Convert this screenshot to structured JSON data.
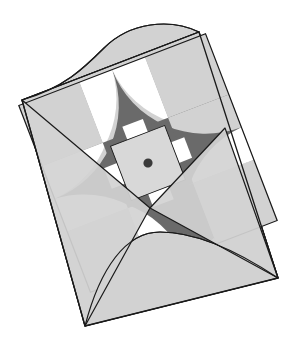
{
  "figure": {
    "type": "geometric-illustration",
    "canvas": {
      "width": 302,
      "height": 360,
      "background": "#ffffff"
    },
    "palette": {
      "white": "#ffffff",
      "light_gray": "#d2d2d2",
      "mid_gray": "#a8a8a8",
      "dark_gray": "#6a6a6a",
      "outline": "#1a1a1a",
      "dot": "#3a3a3a",
      "center_square": "#d8d8d8"
    },
    "stroke_width": 1.2,
    "shapes": {
      "envelope": {
        "name": "envelope-body",
        "fill": "light_gray",
        "corners": {
          "left": [
            22,
            100
          ],
          "top": [
            199,
            32
          ],
          "right": [
            278,
            278
          ],
          "bottom": [
            85,
            326
          ]
        }
      },
      "envelope_flap_top": {
        "name": "envelope-flap-top",
        "fill": "light_gray",
        "description": "upper arched flap rising above the top-left edge"
      },
      "envelope_flap_bottom": {
        "name": "envelope-flap-bottom",
        "fill": "light_gray",
        "description": "lower arched flap with two triangular folds"
      },
      "medallion": {
        "name": "rotated-square-medallion",
        "fill": "dark_gray",
        "description": "rotated square with pinwheel cross arms and four quarter-circle arc cutouts",
        "center": [
          148,
          163
        ],
        "arm_count": 4,
        "arc_cutouts": 4
      },
      "center_tile": {
        "name": "center-tile",
        "fill": "center_square",
        "center": [
          148,
          163
        ],
        "size": 42,
        "tab_count": 4,
        "tab_fill": "white",
        "dot": {
          "center": [
            148,
            163
          ],
          "radius": 3.4,
          "fill": "dot"
        }
      }
    },
    "counts": {
      "white_wedges": 6,
      "dark_arms": 4,
      "mid_gray_overlaps": 5
    }
  }
}
